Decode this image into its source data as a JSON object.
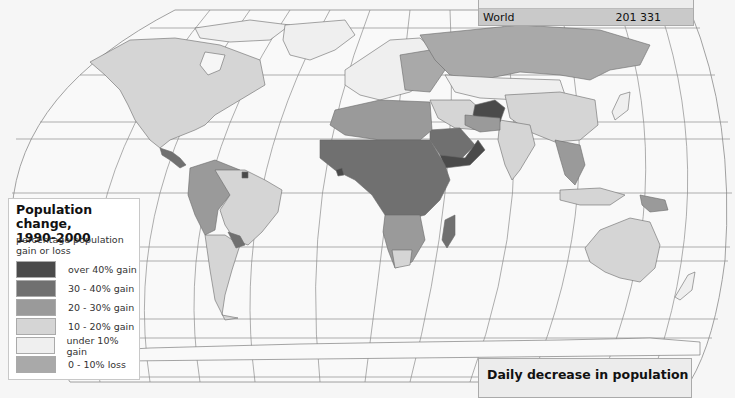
{
  "top_panel": {
    "label": "World",
    "value": "201 331"
  },
  "bottom_panel": {
    "title": "Daily decrease in population"
  },
  "legend": {
    "title_line1": "Population change,",
    "title_line2": "1990-2000",
    "subtitle_line1": "percentage population",
    "subtitle_line2": "gain or loss",
    "items": [
      {
        "label": "over 40% gain",
        "color": "#4a4a4a"
      },
      {
        "label": "30 - 40% gain",
        "color": "#707070"
      },
      {
        "label": "20 - 30% gain",
        "color": "#9a9a9a"
      },
      {
        "label": "10 - 20% gain",
        "color": "#d5d5d5"
      },
      {
        "label": "under 10% gain",
        "color": "#efefef"
      },
      {
        "label": "0 - 10% loss",
        "color": "#a9a9a9"
      }
    ]
  },
  "map": {
    "projection": "world map, curved graticule",
    "ocean_color": "#f6f6f6",
    "graticule_color": "#8a8a8a",
    "regions": [
      {
        "name": "North America (USA/Canada)",
        "class": "10 - 20% gain"
      },
      {
        "name": "Central America",
        "class": "30 - 40% gain"
      },
      {
        "name": "South America (north-west)",
        "class": "20 - 30% gain"
      },
      {
        "name": "Brazil / Argentina",
        "class": "10 - 20% gain"
      },
      {
        "name": "Paraguay",
        "class": "30 - 40% gain"
      },
      {
        "name": "Europe",
        "class": "under 10% gain"
      },
      {
        "name": "Russia",
        "class": "0 - 10% loss"
      },
      {
        "name": "North Africa",
        "class": "20 - 30% gain"
      },
      {
        "name": "Sub-Saharan Africa",
        "class": "30 - 40% gain"
      },
      {
        "name": "Southern Africa",
        "class": "20 - 30% gain"
      },
      {
        "name": "Madagascar",
        "class": "30 - 40% gain"
      },
      {
        "name": "Saudi Arabia",
        "class": "30 - 40% gain"
      },
      {
        "name": "Yemen / Oman",
        "class": "over 40% gain"
      },
      {
        "name": "Afghanistan",
        "class": "over 40% gain"
      },
      {
        "name": "China / India",
        "class": "10 - 20% gain"
      },
      {
        "name": "Kazakhstan / Mongolia",
        "class": "under 10% gain"
      },
      {
        "name": "Southeast Asia",
        "class": "20 - 30% gain"
      },
      {
        "name": "Australia",
        "class": "10 - 20% gain"
      },
      {
        "name": "Greenland",
        "class": "under 10% gain"
      },
      {
        "name": "Antarctica",
        "class": "under 10% gain"
      }
    ]
  }
}
